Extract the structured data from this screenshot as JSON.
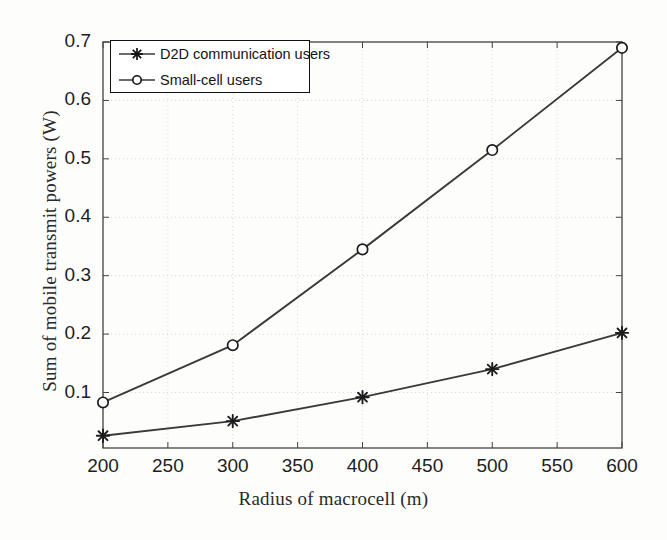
{
  "chart_data": {
    "type": "line",
    "title": "",
    "xlabel": "Radius of macrocell (m)",
    "ylabel": "Sum of mobile transmit powers (W)",
    "x": [
      200,
      300,
      400,
      500,
      600
    ],
    "xlim": [
      200,
      600
    ],
    "ylim": [
      0.005,
      0.7
    ],
    "xticks": [
      200,
      250,
      300,
      350,
      400,
      450,
      500,
      550,
      600
    ],
    "xtick_labels": [
      "200",
      "250",
      "300",
      "350",
      "400",
      "450",
      "500",
      "550",
      "600"
    ],
    "yticks": [
      0.1,
      0.2,
      0.3,
      0.4,
      0.5,
      0.6,
      0.7
    ],
    "ytick_labels": [
      "0.1",
      "0.2",
      "0.3",
      "0.4",
      "0.5",
      "0.6",
      "0.7"
    ],
    "grid": true,
    "legend_position": "upper left",
    "series": [
      {
        "name": "D2D communication users",
        "marker": "star",
        "color": "#3a3a3a",
        "values": [
          0.026,
          0.051,
          0.092,
          0.14,
          0.202
        ]
      },
      {
        "name": "Small-cell users",
        "marker": "circle",
        "color": "#3a3a3a",
        "values": [
          0.083,
          0.181,
          0.345,
          0.515,
          0.69
        ]
      }
    ]
  },
  "legend": {
    "entries": [
      {
        "label": "D2D communication users"
      },
      {
        "label": "Small-cell users"
      }
    ]
  }
}
